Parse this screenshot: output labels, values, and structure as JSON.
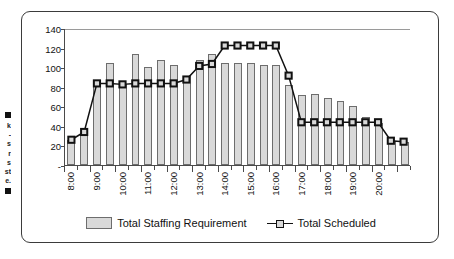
{
  "page_edge_text": {
    "marker_top": "square-bullet",
    "lines": [
      "k",
      "-",
      "s",
      "r",
      "s",
      "st",
      "e."
    ],
    "marker_bottom": "square-bullet"
  },
  "colors": {
    "bar_fill": "#d9d9d9",
    "bar_stroke": "#6d6d6d",
    "line": "#111111",
    "marker_fill": "#d9d9d9",
    "marker_stroke": "#111111",
    "axis": "#4a4a4a",
    "frame": "#3b3b3b",
    "text": "#111111"
  },
  "legend": {
    "position": "bottom-center",
    "entries": [
      {
        "label": "Total Staffing Requirement",
        "kind": "bar-swatch",
        "icon": "bar-swatch-icon"
      },
      {
        "label": "Total Scheduled",
        "kind": "line-marker",
        "icon": "line-marker-icon"
      }
    ]
  },
  "chart_data": {
    "type": "bar",
    "title": "",
    "subtitle": "",
    "xlabel": "",
    "ylabel": "",
    "grid": false,
    "ylim": [
      0,
      140
    ],
    "yticks": [
      "-",
      "20",
      "40",
      "60",
      "80",
      "100",
      "120",
      "140"
    ],
    "ytick_values": [
      0,
      20,
      40,
      60,
      80,
      100,
      120,
      140
    ],
    "xtick_labels": [
      "8:00",
      "9:00",
      "10:00",
      "11:00",
      "12:00",
      "13:00",
      "14:00",
      "15:00",
      "16:00",
      "17:00",
      "18:00",
      "19:00",
      "20:00"
    ],
    "categories": [
      "8:00",
      "8:30",
      "9:00",
      "9:30",
      "10:00",
      "10:30",
      "11:00",
      "11:30",
      "12:00",
      "12:30",
      "13:00",
      "13:30",
      "14:00",
      "14:30",
      "15:00",
      "15:30",
      "16:00",
      "16:30",
      "17:00",
      "17:30",
      "18:00",
      "18:30",
      "19:00",
      "19:30",
      "20:00",
      "20:30",
      "21:00"
    ],
    "series": [
      {
        "name": "Total Staffing Requirement",
        "type": "bar",
        "values": [
          26,
          32,
          84,
          104,
          83,
          113,
          100,
          107,
          102,
          91,
          107,
          113,
          104,
          104,
          104,
          102,
          102,
          82,
          72,
          73,
          68,
          65,
          60,
          49,
          43,
          25,
          24
        ]
      },
      {
        "name": "Total Scheduled",
        "type": "line",
        "marker": "square",
        "values": [
          26,
          34,
          84,
          84,
          83,
          84,
          84,
          84,
          84,
          88,
          102,
          104,
          123,
          123,
          123,
          123,
          123,
          92,
          44,
          44,
          44,
          44,
          44,
          44,
          44,
          25,
          24
        ]
      }
    ]
  }
}
